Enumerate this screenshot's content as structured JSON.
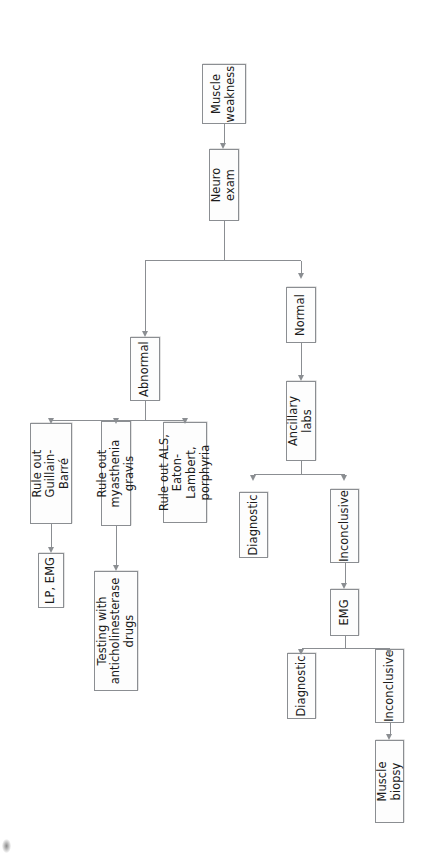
{
  "figure": {
    "type": "flowchart",
    "orientation": "rotated-90-ccw",
    "line_color": "#8b8e92",
    "box_fill": "#fdfdfd",
    "text_color": "#1b1b1b"
  },
  "nodes": {
    "muscle_weakness": "Muscle\nweakness",
    "neuro_exam": "Neuro exam",
    "abnormal": "Abnormal",
    "normal": "Normal",
    "rule_out_guillain_barre": "Rule out Guillain-\nBarré",
    "lp_emg": "LP, EMG",
    "rule_out_myasthenia": "Rule out myasthenia gravis",
    "testing_anticholinesterase": "Testing with\nanticholinesterase drugs",
    "rule_out_als": "Rule out ALS, Eaton-\nLambert, porphyria",
    "ancillary_labs": "Ancillary labs",
    "labs_diagnostic": "Diagnostic",
    "labs_inconclusive": "Inconclusive",
    "emg": "EMG",
    "emg_diagnostic": "Diagnostic",
    "emg_inconclusive": "Inconclusive",
    "muscle_biopsy": "Muscle biopsy"
  },
  "edges": [
    {
      "from": "muscle_weakness",
      "to": "neuro_exam"
    },
    {
      "from": "neuro_exam",
      "to": "abnormal"
    },
    {
      "from": "neuro_exam",
      "to": "normal"
    },
    {
      "from": "abnormal",
      "to": "rule_out_guillain_barre"
    },
    {
      "from": "abnormal",
      "to": "rule_out_myasthenia"
    },
    {
      "from": "abnormal",
      "to": "rule_out_als"
    },
    {
      "from": "rule_out_guillain_barre",
      "to": "lp_emg"
    },
    {
      "from": "rule_out_myasthenia",
      "to": "testing_anticholinesterase"
    },
    {
      "from": "normal",
      "to": "ancillary_labs"
    },
    {
      "from": "ancillary_labs",
      "to": "labs_diagnostic"
    },
    {
      "from": "ancillary_labs",
      "to": "labs_inconclusive"
    },
    {
      "from": "labs_inconclusive",
      "to": "emg"
    },
    {
      "from": "emg",
      "to": "emg_diagnostic"
    },
    {
      "from": "emg",
      "to": "emg_inconclusive"
    },
    {
      "from": "emg_inconclusive",
      "to": "muscle_biopsy"
    }
  ]
}
